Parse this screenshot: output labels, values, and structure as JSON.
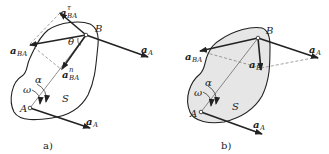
{
  "figure": {
    "panels": [
      {
        "id": "a",
        "caption": "a)",
        "labels": {
          "point_A": "A",
          "point_B": "B",
          "body": "S",
          "omega": "ω",
          "alpha": "α",
          "theta": "θ",
          "aBA_tau_main": "a",
          "aBA_tau_sub": "BA",
          "aBA_tau_sup": "τ",
          "aBA_main": "a",
          "aBA_sub": "BA",
          "aBA_n_main": "a",
          "aBA_n_sub": "BA",
          "aBA_n_sup": "n",
          "aA_B_main": "a",
          "aA_B_sub": "A",
          "aA_A_main": "a",
          "aA_A_sub": "A"
        }
      },
      {
        "id": "b",
        "caption": "b)",
        "labels": {
          "point_A": "A",
          "point_B": "B",
          "body": "S",
          "omega": "ω",
          "alpha": "α",
          "aBA_main": "a",
          "aBA_sub": "BA",
          "aB_main": "a",
          "aB_sub": "B",
          "aA_B_main": "a",
          "aA_B_sub": "A",
          "aA_A_main": "a",
          "aA_A_sub": "A"
        }
      }
    ],
    "colors": {
      "ink": "#222222",
      "body_fill_b": "#e6e6e6",
      "dashed": "#777777"
    }
  }
}
